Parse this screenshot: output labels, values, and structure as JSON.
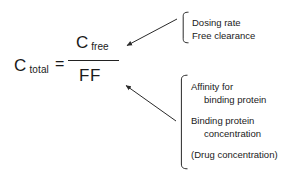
{
  "figure": {
    "background_color": "#ffffff",
    "ink_color": "#1a1a1a",
    "rule_color": "#222222"
  },
  "equation": {
    "left_symbol": "C",
    "left_subscript": "total",
    "equals": "=",
    "numerator_symbol": "C",
    "numerator_subscript": "free",
    "denominator": "FF",
    "plain_text": "C total = C free / FF"
  },
  "callouts": [
    {
      "id": "top",
      "target": "numerator",
      "bracket": "left-brace",
      "groups": [
        {
          "lines": [
            {
              "text": "Dosing rate",
              "indent": false
            },
            {
              "text": "Free clearance",
              "indent": false
            }
          ]
        }
      ]
    },
    {
      "id": "bottom",
      "target": "denominator",
      "bracket": "left-brace",
      "groups": [
        {
          "lines": [
            {
              "text": "Affinity for",
              "indent": false
            },
            {
              "text": "binding protein",
              "indent": true
            }
          ]
        },
        {
          "lines": [
            {
              "text": "Binding protein",
              "indent": false
            },
            {
              "text": "concentration",
              "indent": true
            }
          ]
        },
        {
          "lines": [
            {
              "text": "(Drug concentration)",
              "indent": false
            }
          ]
        }
      ]
    }
  ],
  "arrows": [
    {
      "id": "arrow-to-numerator",
      "from_label": "Dosing rate / Free clearance brace",
      "to_label": "C free numerator"
    },
    {
      "id": "arrow-to-denominator",
      "from_label": "Affinity / Binding protein / Drug concentration brace",
      "to_label": "FF denominator"
    }
  ]
}
